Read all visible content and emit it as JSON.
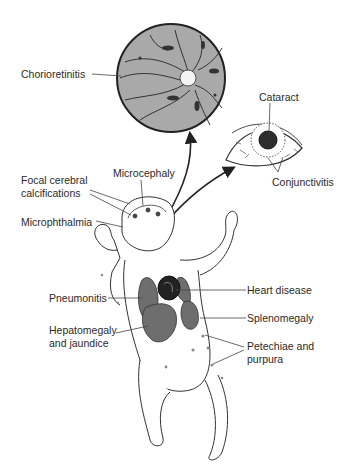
{
  "figure": {
    "type": "medical-illustration"
  },
  "labels": {
    "chorioretinitis": "Chorioretinitis",
    "cataract": "Cataract",
    "conjunctivitis": "Conjunctivitis",
    "focal_line1": "Focal cerebral",
    "focal_line2": "calcifications",
    "microcephaly": "Microcephaly",
    "microphthalmia": "Microphthalmia",
    "pneumonitis": "Pneumonitis",
    "heart_disease": "Heart disease",
    "splenomegaly": "Splenomegaly",
    "hepato_line1": "Hepatomegaly",
    "hepato_line2": "and jaundice",
    "petechiae_line1": "Petechiae and",
    "petechiae_line2": "purpura"
  },
  "colors": {
    "organ_fill": "#6e6e6e",
    "retina_fill": "#a9a9a9",
    "line": "#333333",
    "background": "#ffffff"
  }
}
